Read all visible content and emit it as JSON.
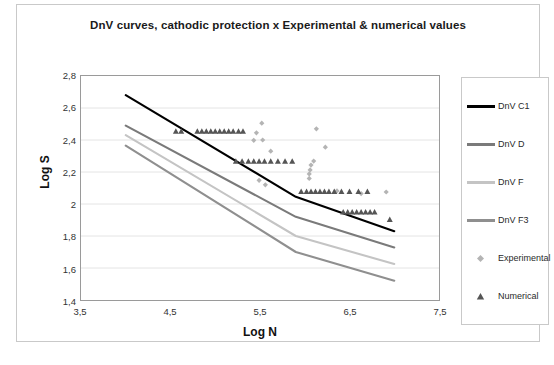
{
  "chart_title": "DnV curves, cathodic protection x Experimental & numerical values",
  "axes": {
    "x_title": "Log N",
    "y_title": "Log S",
    "x_ticks": [
      "3,5",
      "4,5",
      "5,5",
      "6,5",
      "7,5"
    ],
    "y_ticks": [
      "2,8",
      "2,6",
      "2,4",
      "2,2",
      "2",
      "1,8",
      "1,6",
      "1,4"
    ]
  },
  "legend": {
    "items": [
      {
        "label": "DnV C1",
        "marker": "line",
        "color": "#000000"
      },
      {
        "label": "DnV D",
        "marker": "line",
        "color": "#7a7a7a"
      },
      {
        "label": "DnV F",
        "marker": "line",
        "color": "#c4c4c4"
      },
      {
        "label": "DnV F3",
        "marker": "line",
        "color": "#8f8f8f"
      },
      {
        "label": "Experimental",
        "marker": "diamond",
        "color": "#b4b4b4"
      },
      {
        "label": "Numerical",
        "marker": "triangle",
        "color": "#555555"
      }
    ]
  },
  "chart_data": {
    "type": "line",
    "title": "DnV curves, cathodic protection x Experimental & numerical values",
    "xlabel": "Log N",
    "ylabel": "Log S",
    "xlim": [
      3.5,
      7.5
    ],
    "ylim": [
      1.4,
      2.8
    ],
    "xticks": [
      3.5,
      4.5,
      5.5,
      6.5,
      7.5
    ],
    "yticks": [
      1.4,
      1.6,
      1.8,
      2.0,
      2.2,
      2.4,
      2.6,
      2.8
    ],
    "grid": "horizontal",
    "legend_position": "right",
    "series": [
      {
        "name": "DnV C1",
        "type": "line",
        "color": "#000000",
        "x": [
          4.0,
          5.9,
          7.0
        ],
        "y": [
          2.68,
          2.045,
          1.83
        ]
      },
      {
        "name": "DnV D",
        "type": "line",
        "color": "#7a7a7a",
        "x": [
          4.0,
          5.9,
          7.0
        ],
        "y": [
          2.49,
          1.92,
          1.728
        ]
      },
      {
        "name": "DnV F",
        "type": "line",
        "color": "#c4c4c4",
        "x": [
          4.0,
          5.9,
          7.0
        ],
        "y": [
          2.43,
          1.8,
          1.625
        ]
      },
      {
        "name": "DnV F3",
        "type": "line",
        "color": "#8f8f8f",
        "x": [
          4.0,
          5.9,
          7.0
        ],
        "y": [
          2.365,
          1.7,
          1.52
        ]
      },
      {
        "name": "Experimental",
        "type": "scatter",
        "marker": "diamond",
        "color": "#b4b4b4",
        "points": [
          [
            5.46,
            2.445
          ],
          [
            5.52,
            2.505
          ],
          [
            5.43,
            2.398
          ],
          [
            5.53,
            2.4
          ],
          [
            5.62,
            2.33
          ],
          [
            6.13,
            2.47
          ],
          [
            6.23,
            2.355
          ],
          [
            6.1,
            2.268
          ],
          [
            6.07,
            2.243
          ],
          [
            6.06,
            2.213
          ],
          [
            6.05,
            2.188
          ],
          [
            6.05,
            2.16
          ],
          [
            5.49,
            2.148
          ],
          [
            5.56,
            2.12
          ],
          [
            6.36,
            2.082
          ],
          [
            6.63,
            2.065
          ],
          [
            6.91,
            2.075
          ]
        ]
      },
      {
        "name": "Numerical",
        "type": "scatter",
        "marker": "triangle",
        "color": "#555555",
        "points": [
          [
            4.56,
            2.455
          ],
          [
            4.62,
            2.455
          ],
          [
            4.8,
            2.455
          ],
          [
            4.85,
            2.455
          ],
          [
            4.9,
            2.455
          ],
          [
            4.95,
            2.455
          ],
          [
            5.0,
            2.455
          ],
          [
            5.05,
            2.455
          ],
          [
            5.1,
            2.455
          ],
          [
            5.15,
            2.455
          ],
          [
            5.2,
            2.455
          ],
          [
            5.26,
            2.455
          ],
          [
            5.31,
            2.455
          ],
          [
            5.23,
            2.268
          ],
          [
            5.3,
            2.268
          ],
          [
            5.37,
            2.268
          ],
          [
            5.43,
            2.268
          ],
          [
            5.49,
            2.268
          ],
          [
            5.55,
            2.268
          ],
          [
            5.62,
            2.268
          ],
          [
            5.7,
            2.268
          ],
          [
            5.78,
            2.268
          ],
          [
            5.86,
            2.268
          ],
          [
            5.96,
            2.078
          ],
          [
            6.02,
            2.078
          ],
          [
            6.07,
            2.078
          ],
          [
            6.12,
            2.078
          ],
          [
            6.17,
            2.078
          ],
          [
            6.22,
            2.078
          ],
          [
            6.27,
            2.078
          ],
          [
            6.33,
            2.078
          ],
          [
            6.41,
            2.078
          ],
          [
            6.5,
            2.078
          ],
          [
            6.6,
            2.078
          ],
          [
            6.7,
            2.078
          ],
          [
            6.43,
            1.95
          ],
          [
            6.48,
            1.95
          ],
          [
            6.53,
            1.95
          ],
          [
            6.58,
            1.95
          ],
          [
            6.63,
            1.95
          ],
          [
            6.68,
            1.95
          ],
          [
            6.73,
            1.95
          ],
          [
            6.78,
            1.95
          ],
          [
            6.95,
            1.903
          ]
        ]
      }
    ]
  }
}
